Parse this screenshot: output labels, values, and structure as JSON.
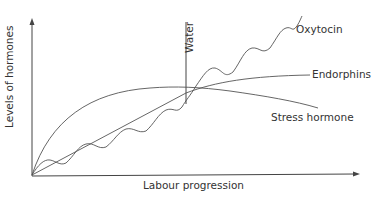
{
  "diagram": {
    "title": "",
    "axes": {
      "x_label": "Labour progression",
      "y_label": "Levels of hormones"
    },
    "marker": {
      "label": "Water"
    },
    "curves": [
      {
        "name": "Oxytocin",
        "label": "Oxytocin",
        "shape": "wavy, rising linearly then steeply after Water"
      },
      {
        "name": "Endorphins",
        "label": "Endorphins",
        "shape": "rising, levelling off"
      },
      {
        "name": "Stress hormone",
        "label": "Stress hormone",
        "shape": "rapid rise, plateau, decline after Water"
      }
    ],
    "colors": {
      "line": "#555555",
      "text": "#333333",
      "background": "#ffffff"
    }
  }
}
